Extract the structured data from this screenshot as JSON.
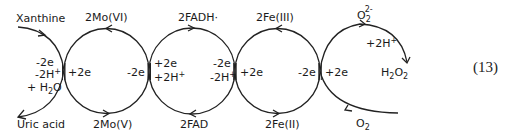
{
  "diagram": {
    "inputs": {
      "xanthine": "Xanthine",
      "uric_acid": "Uric acid",
      "o2": "O",
      "o2_sub": "2"
    },
    "left_labels": {
      "minus2e": "-2e",
      "minus2h": "-2H",
      "plus": "+",
      "h2o_a": "+ H",
      "h2o_sub": "2",
      "h2o_b": "O"
    },
    "mo": {
      "top": "2Mo(VI)",
      "bottom": "2Mo(V)",
      "left": "+2e",
      "right": "-2e"
    },
    "fad": {
      "top": "2FADH·",
      "bottom": "2FAD",
      "left1": "+2e",
      "left2": "+2H",
      "left2_sup": "+",
      "right1": "-2e",
      "right2": "-2H",
      "right2_sup": "+"
    },
    "fe": {
      "top": "2Fe(III)",
      "bottom": "2Fe(II)",
      "left": "+2e",
      "right": "-2e"
    },
    "oxygen": {
      "right": "+2e",
      "superoxide": "O",
      "superoxide_sub": "2",
      "superoxide_sup": "2-",
      "protons": "+2H",
      "protons_sup": "+",
      "h2o2_a": "H",
      "h2o2_s1": "2",
      "h2o2_b": "O",
      "h2o2_s2": "2"
    },
    "equation_number": "(13)"
  }
}
